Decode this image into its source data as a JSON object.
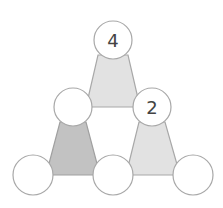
{
  "diagram": {
    "type": "number-triangle-puzzle",
    "colors": {
      "background": "#ffffff",
      "circle_fill": "#ffffff",
      "circle_stroke": "#a8a8a8",
      "triangle_light": "#e2e2e2",
      "triangle_dark": "#c2c2c2",
      "triangle_stroke": "#a8a8a8"
    },
    "circles": [
      {
        "id": "top",
        "cx": 113,
        "cy": 40,
        "r": 19,
        "value": "4"
      },
      {
        "id": "middle-left",
        "cx": 73,
        "cy": 107,
        "r": 19,
        "value": ""
      },
      {
        "id": "middle-right",
        "cx": 152,
        "cy": 107,
        "r": 19,
        "value": "2"
      },
      {
        "id": "bottom-left",
        "cx": 33,
        "cy": 175,
        "r": 20,
        "value": ""
      },
      {
        "id": "bottom-middle",
        "cx": 113,
        "cy": 175,
        "r": 20,
        "value": ""
      },
      {
        "id": "bottom-right",
        "cx": 193,
        "cy": 175,
        "r": 20,
        "value": ""
      }
    ],
    "triangles": [
      {
        "id": "top-triangle",
        "shade": "light"
      },
      {
        "id": "bottom-left-triangle",
        "shade": "dark"
      },
      {
        "id": "bottom-right-triangle",
        "shade": "light"
      }
    ]
  }
}
